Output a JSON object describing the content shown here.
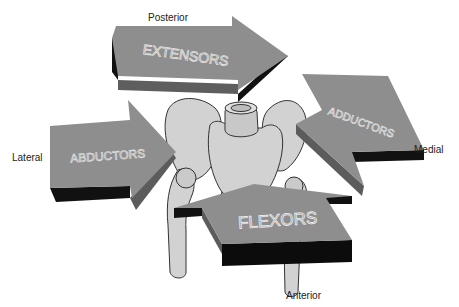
{
  "diagram": {
    "colors": {
      "background": "#ffffff",
      "arrow_face": "#8e8e8e",
      "arrow_side": "#5a5a5a",
      "arrow_shadow": "#0a0a0a",
      "bone_fill": "#cfcfcf",
      "bone_outline": "#333333",
      "label_text": "#222222"
    },
    "directions": {
      "top": "Posterior",
      "left": "Lateral",
      "right": "Medial",
      "bottom": "Anterior"
    },
    "arrows": [
      {
        "id": "top",
        "label": "EXTENSORS",
        "points_toward": "right"
      },
      {
        "id": "left",
        "label": "ABDUCTORS",
        "points_toward": "right"
      },
      {
        "id": "right",
        "label": "ADDUCTORS",
        "points_toward": "left"
      },
      {
        "id": "bottom",
        "label": "FLEXORS",
        "points_toward": "up"
      }
    ]
  }
}
